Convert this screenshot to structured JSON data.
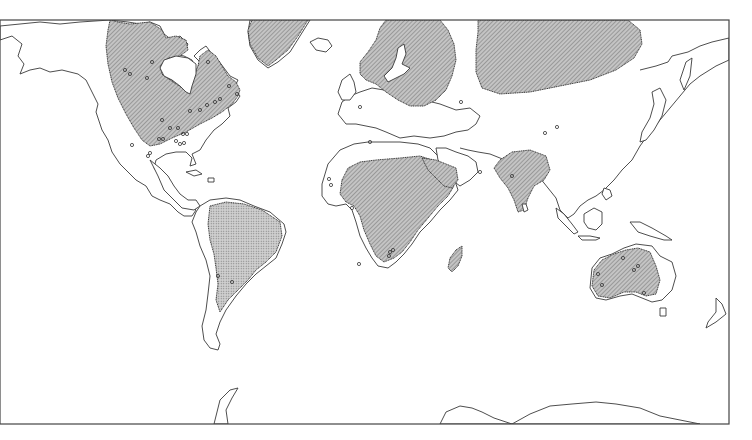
{
  "map": {
    "type": "world-map",
    "projection": "equirectangular-like",
    "frame": {
      "x": 0,
      "y": 20,
      "width": 729,
      "height": 404
    },
    "colors": {
      "background": "#ffffff",
      "coastline": "#3a3a3a",
      "shield_fill": "#b8b8b8",
      "hatch_line": "#6e6e6e",
      "site_marker": "#333333"
    },
    "shaded_regions": [
      {
        "name": "canadian-shield",
        "pattern": "hatch"
      },
      {
        "name": "greenland-shield",
        "pattern": "hatch"
      },
      {
        "name": "baltic-shield",
        "pattern": "hatch"
      },
      {
        "name": "siberian-shield",
        "pattern": "hatch"
      },
      {
        "name": "african-shield",
        "pattern": "hatch"
      },
      {
        "name": "arabian-shield",
        "pattern": "hatch"
      },
      {
        "name": "indian-shield",
        "pattern": "hatch"
      },
      {
        "name": "madagascar-shield",
        "pattern": "hatch"
      },
      {
        "name": "south-american-shield",
        "pattern": "dots"
      },
      {
        "name": "australian-shield",
        "pattern": "hatch"
      }
    ],
    "site_markers": [
      [
        125,
        70
      ],
      [
        130,
        74
      ],
      [
        147,
        78
      ],
      [
        152,
        62
      ],
      [
        208,
        62
      ],
      [
        229,
        86
      ],
      [
        237,
        94
      ],
      [
        207,
        105
      ],
      [
        215,
        102
      ],
      [
        220,
        99
      ],
      [
        200,
        110
      ],
      [
        190,
        111
      ],
      [
        162,
        120
      ],
      [
        170,
        128
      ],
      [
        178,
        128
      ],
      [
        159,
        139
      ],
      [
        163,
        139
      ],
      [
        176,
        141
      ],
      [
        180,
        144
      ],
      [
        184,
        143
      ],
      [
        183,
        134
      ],
      [
        187,
        134
      ],
      [
        132,
        145
      ],
      [
        150,
        153
      ],
      [
        148,
        156
      ],
      [
        360,
        107
      ],
      [
        370,
        142
      ],
      [
        329,
        179
      ],
      [
        331,
        185
      ],
      [
        352,
        208
      ],
      [
        390,
        252
      ],
      [
        389,
        256
      ],
      [
        393,
        250
      ],
      [
        359,
        264
      ],
      [
        461,
        102
      ],
      [
        480,
        172
      ],
      [
        512,
        176
      ],
      [
        545,
        133
      ],
      [
        557,
        127
      ],
      [
        218,
        276
      ],
      [
        232,
        282
      ],
      [
        623,
        258
      ],
      [
        634,
        270
      ],
      [
        638,
        266
      ],
      [
        598,
        274
      ],
      [
        602,
        285
      ],
      [
        644,
        293
      ]
    ]
  }
}
